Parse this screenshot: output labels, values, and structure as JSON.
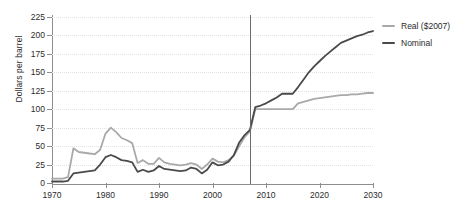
{
  "chart_data": {
    "type": "line",
    "title": "",
    "xlabel": "",
    "ylabel": "Dollars per barrel",
    "xlim": [
      1970,
      2030
    ],
    "ylim": [
      0,
      225
    ],
    "grid": true,
    "legend_position": "right",
    "x_ticks": [
      "1970",
      "1980",
      "1990",
      "2000",
      "2010",
      "2020",
      "2030"
    ],
    "x_tick_values": [
      1970,
      1980,
      1990,
      2000,
      2010,
      2020,
      2030
    ],
    "y_ticks": [
      "0",
      "25",
      "50",
      "75",
      "100",
      "125",
      "150",
      "175",
      "200",
      "225"
    ],
    "y_tick_values": [
      0,
      25,
      50,
      75,
      100,
      125,
      150,
      175,
      200,
      225
    ],
    "annotations": [
      {
        "type": "vline",
        "x": 2007,
        "label": "",
        "color": "#6b6b6b"
      }
    ],
    "x": [
      1970,
      1971,
      1972,
      1973,
      1974,
      1975,
      1976,
      1977,
      1978,
      1979,
      1980,
      1981,
      1982,
      1983,
      1984,
      1985,
      1986,
      1987,
      1988,
      1989,
      1990,
      1991,
      1992,
      1993,
      1994,
      1995,
      1996,
      1997,
      1998,
      1999,
      2000,
      2001,
      2002,
      2003,
      2004,
      2005,
      2006,
      2007,
      2008,
      2009,
      2010,
      2011,
      2012,
      2013,
      2014,
      2015,
      2016,
      2017,
      2018,
      2019,
      2020,
      2021,
      2022,
      2023,
      2024,
      2025,
      2026,
      2027,
      2028,
      2029,
      2030
    ],
    "series": [
      {
        "name": "Real ($2007)",
        "color": "#a9a9a9",
        "values": [
          6,
          6,
          6,
          8,
          47,
          42,
          41,
          40,
          39,
          45,
          67,
          75,
          69,
          61,
          58,
          54,
          27,
          31,
          26,
          26,
          34,
          28,
          26,
          25,
          24,
          25,
          27,
          25,
          19,
          25,
          33,
          29,
          28,
          31,
          37,
          50,
          62,
          70,
          100,
          100,
          100,
          100,
          100,
          100,
          100,
          100,
          108,
          110,
          112,
          114,
          115,
          116,
          117,
          118,
          119,
          119,
          120,
          120,
          121,
          122,
          122
        ]
      },
      {
        "name": "Nominal",
        "color": "#4a4a4a",
        "values": [
          2,
          2,
          2,
          3,
          13,
          14,
          15,
          16,
          17,
          25,
          35,
          38,
          35,
          31,
          30,
          28,
          15,
          18,
          15,
          17,
          23,
          19,
          18,
          17,
          16,
          17,
          21,
          19,
          13,
          18,
          28,
          24,
          25,
          29,
          38,
          55,
          65,
          72,
          103,
          105,
          108,
          112,
          116,
          121,
          121,
          121,
          130,
          140,
          150,
          158,
          165,
          172,
          178,
          184,
          190,
          193,
          196,
          199,
          201,
          204,
          206
        ]
      }
    ]
  },
  "legend": {
    "items": [
      {
        "label": "Real ($2007)",
        "color": "#a9a9a9"
      },
      {
        "label": "Nominal",
        "color": "#4a4a4a"
      }
    ]
  }
}
